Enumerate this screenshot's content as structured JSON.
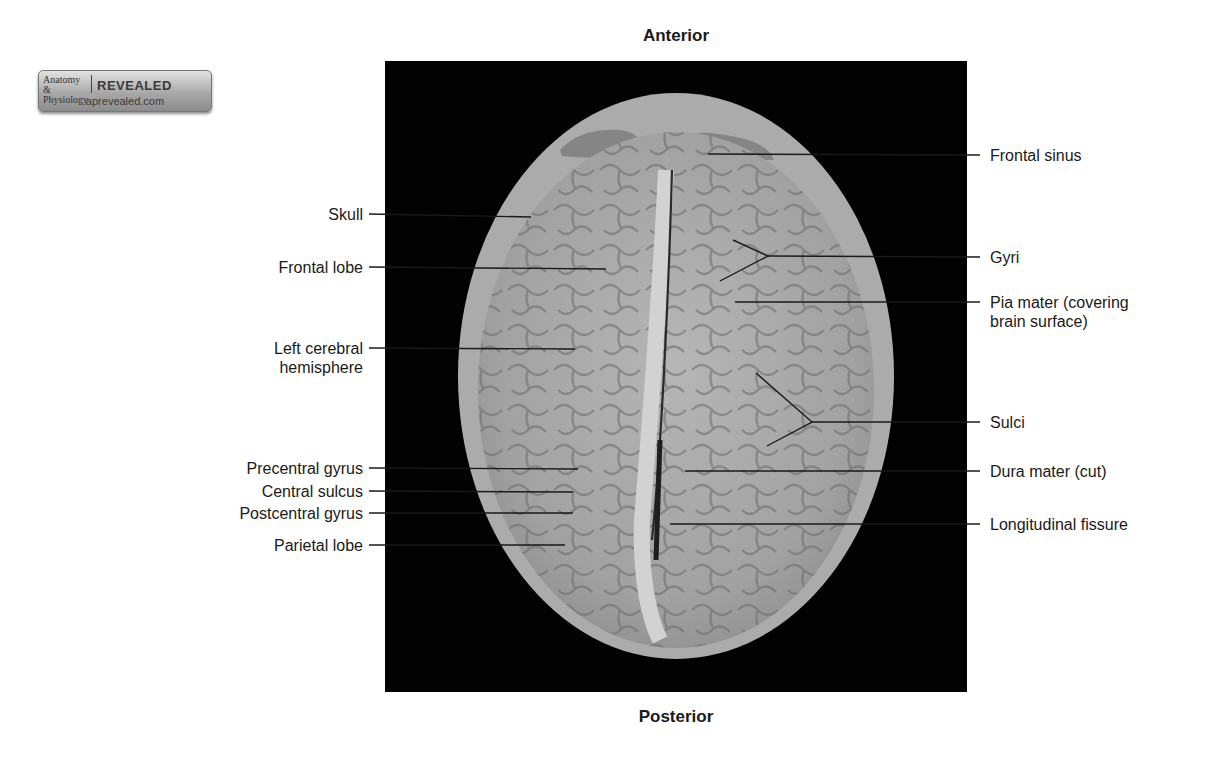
{
  "figure": {
    "orientation": {
      "top": "Anterior",
      "bottom": "Posterior"
    },
    "logo": {
      "line1": "Anatomy & Physiology",
      "line2": "REVEALED",
      "line3": "aprevealed.com"
    },
    "photo_description": "Superior view of brain within opened skull (dissection photograph)",
    "labels_left": [
      {
        "id": "skull",
        "text": "Skull"
      },
      {
        "id": "frontal-lobe",
        "text": "Frontal lobe"
      },
      {
        "id": "left-cerebral-hemisphere",
        "text": "Left cerebral",
        "text2": "hemisphere"
      },
      {
        "id": "precentral-gyrus",
        "text": "Precentral gyrus"
      },
      {
        "id": "central-sulcus",
        "text": "Central sulcus"
      },
      {
        "id": "postcentral-gyrus",
        "text": "Postcentral gyrus"
      },
      {
        "id": "parietal-lobe",
        "text": "Parietal lobe"
      }
    ],
    "labels_right": [
      {
        "id": "frontal-sinus",
        "text": "Frontal sinus"
      },
      {
        "id": "gyri",
        "text": "Gyri"
      },
      {
        "id": "pia-mater",
        "text": "Pia mater (covering",
        "text2": "brain surface)"
      },
      {
        "id": "sulci",
        "text": "Sulci"
      },
      {
        "id": "dura-mater",
        "text": "Dura mater (cut)"
      },
      {
        "id": "longitudinal-fissure",
        "text": "Longitudinal fissure"
      }
    ],
    "colors": {
      "background": "#ffffff",
      "photo_background": "#020202",
      "brain": "#a9a9a9",
      "text": "#1a1a1a"
    }
  }
}
